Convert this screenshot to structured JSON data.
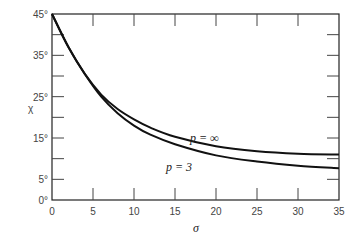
{
  "chart_data": {
    "type": "line",
    "title": "",
    "xlabel": "σ",
    "ylabel": "χ",
    "xlim": [
      0,
      35
    ],
    "ylim": [
      0,
      45
    ],
    "x_ticks": [
      "0",
      "5",
      "10",
      "15",
      "20",
      "25",
      "30",
      "35"
    ],
    "y_ticks": [
      "0°",
      "5°",
      "15°",
      "25°",
      "35°",
      "45°"
    ],
    "grid": false,
    "series": [
      {
        "name": "p = ∞",
        "x": [
          0,
          2,
          4,
          6,
          8,
          10,
          12,
          15,
          20,
          25,
          30,
          35
        ],
        "values": [
          45,
          37,
          30.5,
          25.5,
          22,
          19.5,
          17.5,
          15.3,
          13,
          11.8,
          11.2,
          11
        ]
      },
      {
        "name": "p = 3",
        "x": [
          0,
          2,
          4,
          6,
          8,
          10,
          12,
          15,
          20,
          25,
          30,
          35
        ],
        "values": [
          45,
          37,
          30.5,
          25,
          21,
          18,
          15.8,
          13.5,
          10.8,
          9.3,
          8.3,
          7.7
        ]
      }
    ],
    "annotations": [
      "p = ∞",
      "p = 3"
    ]
  }
}
